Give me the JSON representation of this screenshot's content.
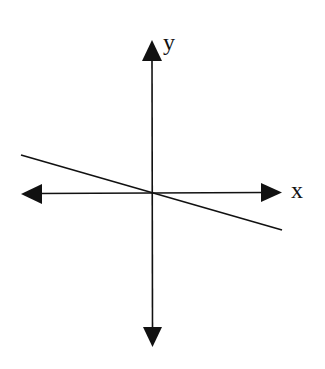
{
  "diagram": {
    "type": "coordinate-plane",
    "axes": {
      "x_label": "x",
      "y_label": "y",
      "origin": [
        152,
        193
      ],
      "x_axis": {
        "from": [
          21,
          193
        ],
        "to": [
          282,
          193
        ],
        "arrows": "both"
      },
      "y_axis": {
        "from": [
          152,
          40
        ],
        "to": [
          152,
          347
        ],
        "arrows": "both"
      }
    },
    "line": {
      "description": "straight line with negative slope passing through the origin",
      "from": [
        21,
        155
      ],
      "to": [
        282,
        230
      ],
      "slope_sign": "negative"
    },
    "colors": {
      "stroke": "#111111",
      "background": "#ffffff"
    }
  }
}
